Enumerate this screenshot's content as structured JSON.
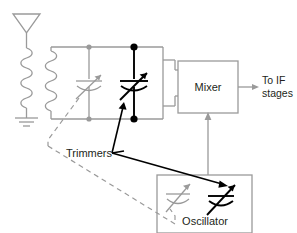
{
  "diagram": {
    "colors": {
      "wire_gray": "#9a9a9a",
      "wire_black": "#000000",
      "text": "#231f20",
      "background": "#ffffff"
    },
    "labels": {
      "mixer": "Mixer",
      "to_if_line1": "To IF",
      "to_if_line2": "stages",
      "trimmers": "Trimmers",
      "oscillator": "Oscillator"
    },
    "components": [
      {
        "name": "antenna",
        "type": "antenna-symbol"
      },
      {
        "name": "antenna-coil",
        "type": "inductor"
      },
      {
        "name": "ground",
        "type": "ground-symbol"
      },
      {
        "name": "tank-coil",
        "type": "inductor"
      },
      {
        "name": "rf-trimmer-capacitor",
        "type": "variable-capacitor",
        "color": "#9a9a9a"
      },
      {
        "name": "rf-tuning-capacitor",
        "type": "variable-capacitor",
        "color": "#000000"
      },
      {
        "name": "mixer-block",
        "type": "block"
      },
      {
        "name": "oscillator-block",
        "type": "block"
      },
      {
        "name": "oscillator-trimmer-capacitor",
        "type": "variable-capacitor",
        "color": "#9a9a9a"
      },
      {
        "name": "oscillator-tuning-capacitor",
        "type": "variable-capacitor",
        "color": "#000000"
      }
    ],
    "connections": [
      {
        "name": "oscillator-to-mixer",
        "style": "solid-arrow",
        "color": "#9a9a9a"
      },
      {
        "name": "mixer-to-if-stages",
        "style": "solid-arrow",
        "color": "#9a9a9a"
      },
      {
        "name": "trimmers-leader-gray-dashed",
        "style": "dashed",
        "color": "#9a9a9a"
      },
      {
        "name": "trimmers-leader-black-solid",
        "style": "solid-arrow",
        "color": "#000000"
      }
    ]
  }
}
